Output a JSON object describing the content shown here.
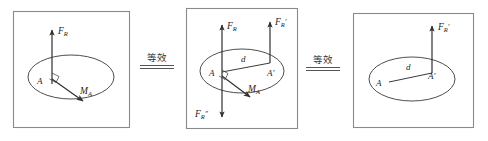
{
  "figure": {
    "background_color": "#ffffff",
    "stroke_color": "#3a3a3a",
    "panel_border_color": "#7a7a7a",
    "label_color": "#222222",
    "panels": [
      {
        "id": "panel-left",
        "labels": {
          "force_resultant": "F",
          "force_resultant_sub": "R",
          "moment": "M",
          "moment_sub": "A",
          "point_a": "A"
        }
      },
      {
        "id": "panel-middle",
        "labels": {
          "force_resultant": "F",
          "force_resultant_sub": "R",
          "force_prime": "F",
          "force_prime_sub": "R",
          "force_prime_mark": "′",
          "force_double_prime": "F",
          "force_double_prime_sub": "R",
          "force_double_prime_mark": "″",
          "distance": "d",
          "moment": "M",
          "moment_sub": "A",
          "point_a": "A",
          "point_a_prime": "A′"
        }
      },
      {
        "id": "panel-right",
        "labels": {
          "force_prime": "F",
          "force_prime_sub": "R",
          "force_prime_mark": "′",
          "distance": "d",
          "point_a": "A",
          "point_a_prime": "A′"
        }
      }
    ],
    "connectors": [
      {
        "id": "equiv-1",
        "text": "等效"
      },
      {
        "id": "equiv-2",
        "text": "等效"
      }
    ]
  }
}
